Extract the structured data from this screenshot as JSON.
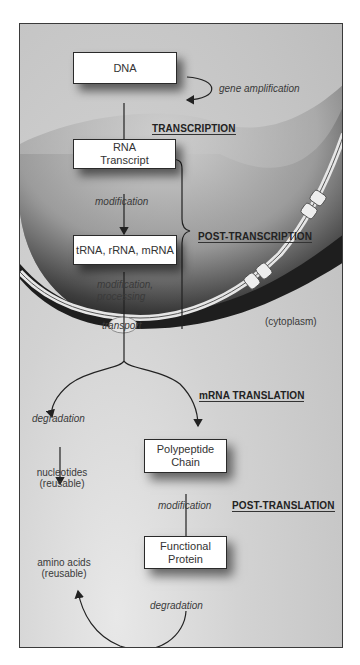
{
  "diagram": {
    "nodes": {
      "dna": {
        "line1": "DNA"
      },
      "rna_transcript": {
        "line1": "RNA",
        "line2": "Transcript"
      },
      "trna_rrna_mrna": {
        "line1": "tRNA, rRNA, mRNA"
      },
      "polypeptide": {
        "line1": "Polypeptide",
        "line2": "Chain"
      },
      "functional_protein": {
        "line1": "Functional",
        "line2": "Protein"
      }
    },
    "edge_labels": {
      "gene_amplification": "gene amplification",
      "modification_1": "modification",
      "modification_processing_1": "modification,",
      "modification_processing_2": "processing",
      "transport": "transport",
      "degradation_rna": "degradation",
      "modification_2": "modification",
      "degradation_protein": "degradation"
    },
    "products": {
      "nucleotides_1": "nucleotides",
      "nucleotides_2": "(reusable)",
      "amino_acids_1": "amino acids",
      "amino_acids_2": "(reusable)"
    },
    "regions": {
      "nucleus": "(nucleus)",
      "cytoplasm": "(cytoplasm)"
    },
    "stages": {
      "transcription": "TRANSCRIPTION",
      "post_transcription": "POST-TRANSCRIPTION",
      "mrna_translation": "mRNA TRANSLATION",
      "post_translation": "POST-TRANSLATION"
    }
  }
}
